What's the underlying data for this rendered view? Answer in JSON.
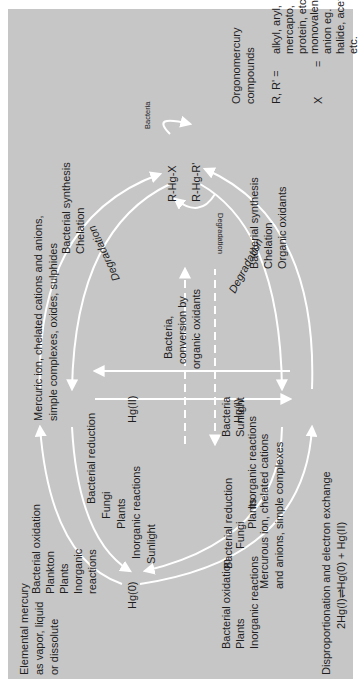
{
  "colors": {
    "panel": "#c6c6c6",
    "arrows": "#ffffff",
    "text": "#1e1e1e",
    "margin": "#ffffff"
  },
  "species": {
    "hg0": "Hg(0)",
    "hg2": "Hg(II)",
    "hg1": "Hg(I)",
    "rhgx": "R-Hg-X",
    "rhgr": "R-Hg-R'"
  },
  "descriptions": {
    "elemental": [
      "Elemental mercury",
      "as vapor, liquid",
      "or dissolute"
    ],
    "mercuric": [
      "Mercuric ion, chelated cations and anions,",
      "simple complexes, oxides, sulphides"
    ],
    "mercurous": [
      "Mercurous ion, chelated cations",
      "and anions, simple complexes"
    ],
    "organomercury": [
      "Orgonomercury",
      "compounds"
    ],
    "r_def_lhs": "R, R'  =",
    "r_def": [
      "alkyl, aryl,",
      "mercapto,",
      "protein, etc."
    ],
    "x_lhs": "X",
    "x_eq": "=",
    "x_def": [
      "monovalent",
      "anion eg.",
      "halide, acetate,",
      "etc."
    ],
    "disproportionation": [
      "Disproportionation and electron exchange",
      "2Hg(I)⇌Hg(0)  +  Hg(II)"
    ]
  },
  "processes": {
    "hg0_to_hg2": [
      "Bacterial oxidation",
      "Plankton",
      "Plants",
      "Inorganic",
      "reactions"
    ],
    "hg2_to_hg0": [
      "Bacterial reduction",
      "Fungi",
      "Plants",
      "Inorganic reactions",
      "Sunlight"
    ],
    "hg2_to_org": [
      "Bacterial synthesis",
      "Chelation"
    ],
    "org_to_hg2": "Degradation",
    "org_cycle_top": "Bacteria",
    "org_cycle_bottom": "Degradation",
    "hg1_to_hg2": [
      "Bacteria,",
      "conversion by",
      "organic oxidants"
    ],
    "hg2_to_hg1": [
      "Bacteria",
      "Sunlight"
    ],
    "hg1_to_hg0": [
      "Bacterial reduction",
      "Fungi",
      "Plants",
      "Inorganic reactions"
    ],
    "hg0_to_hg1": [
      "Bacterial oxidation",
      "Plants",
      "Inorganic reactions"
    ],
    "hg1_to_org": [
      "Bacterial synthesis",
      "Chelation",
      "Organic oxidants"
    ],
    "org_to_hg1": "Degradation"
  }
}
